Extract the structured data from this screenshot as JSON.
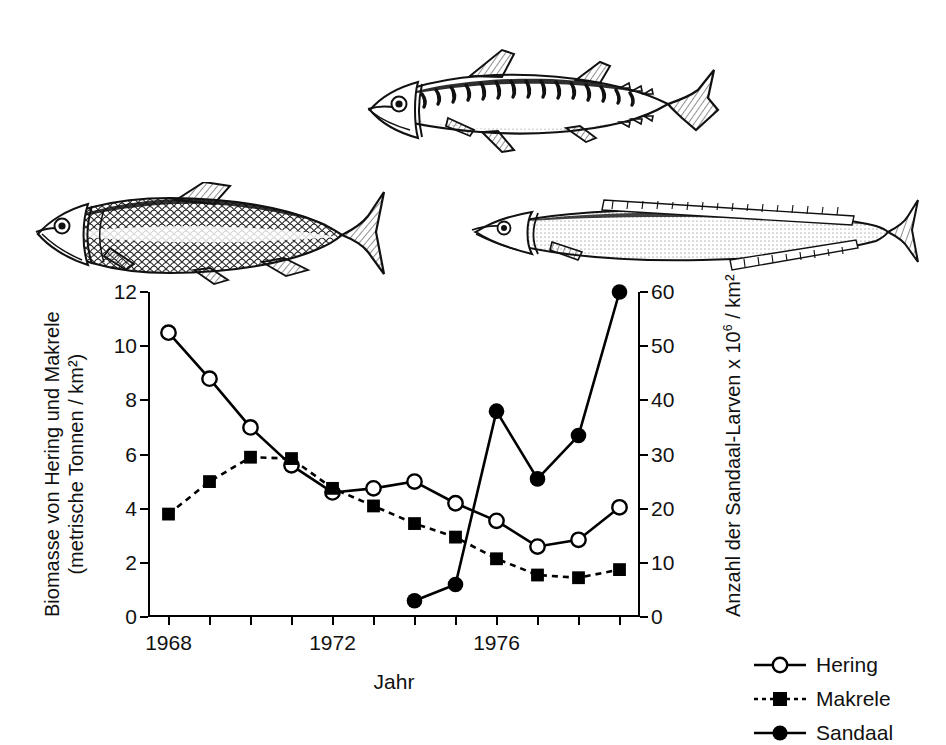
{
  "chart_data": {
    "type": "line",
    "title": "",
    "xlabel": "Jahr",
    "ylabel": "Biomasse von Hering und Makrele (metrische Tonnen / km²)",
    "ylabel_line1": "Biomasse von Hering und Makrele",
    "ylabel_line2": "(metrische Tonnen / km²)",
    "y2label_pre": "Anzahl der Sandaal-Larven x 10",
    "y2label_sup": "6",
    "y2label_post": " / km²",
    "y2label": "Anzahl der Sandaal-Larven x 10⁶ / km²",
    "x": [
      1968,
      1969,
      1970,
      1971,
      1972,
      1973,
      1974,
      1975,
      1976,
      1977,
      1978,
      1979
    ],
    "xlim": [
      1967.5,
      1979.5
    ],
    "xticks": [
      1968,
      1969,
      1970,
      1971,
      1972,
      1973,
      1974,
      1975,
      1976,
      1977,
      1978,
      1979
    ],
    "xtick_labels": [
      "1968",
      "",
      "",
      "",
      "1972",
      "",
      "",
      "",
      "1976",
      "",
      "",
      ""
    ],
    "ylim": [
      0,
      12
    ],
    "yticks": [
      0,
      2,
      4,
      6,
      8,
      10,
      12
    ],
    "ytick_labels": [
      "0",
      "2",
      "4",
      "6",
      "8",
      "10",
      "12"
    ],
    "y2lim": [
      0,
      60
    ],
    "y2ticks": [
      0,
      10,
      20,
      30,
      40,
      50,
      60
    ],
    "y2tick_labels": [
      "0",
      "10",
      "20",
      "30",
      "40",
      "50",
      "60"
    ],
    "grid": false,
    "legend_position": "right",
    "series": [
      {
        "name": "Hering",
        "axis": "left",
        "marker": "open-circle",
        "line": "solid",
        "values": [
          10.5,
          8.8,
          7.0,
          5.6,
          4.6,
          4.75,
          5.0,
          4.2,
          3.55,
          2.6,
          2.85,
          4.05
        ]
      },
      {
        "name": "Makrele",
        "axis": "left",
        "marker": "filled-square",
        "line": "dashed",
        "values": [
          3.8,
          5.0,
          5.9,
          5.85,
          4.75,
          4.1,
          3.45,
          2.95,
          2.15,
          1.55,
          1.45,
          1.75
        ]
      },
      {
        "name": "Sandaal",
        "axis": "right",
        "marker": "filled-circle",
        "line": "solid",
        "values": [
          null,
          null,
          null,
          null,
          null,
          null,
          3.0,
          6.0,
          38.0,
          25.5,
          33.5,
          60.0
        ]
      }
    ]
  },
  "legend": {
    "items": [
      {
        "label": "Hering",
        "symbol": "open-circle-solid-line"
      },
      {
        "label": "Makrele",
        "symbol": "filled-square-dashed-line"
      },
      {
        "label": "Sandaal",
        "symbol": "filled-circle-solid-line"
      }
    ]
  },
  "illustrations": [
    {
      "name": "mackerel",
      "caption": "Makrele"
    },
    {
      "name": "herring",
      "caption": "Hering"
    },
    {
      "name": "sandeel",
      "caption": "Sandaal"
    }
  ],
  "colors": {
    "ink": "#000000",
    "background": "#ffffff",
    "marker_fill_open": "#ffffff",
    "marker_fill_solid": "#000000"
  }
}
